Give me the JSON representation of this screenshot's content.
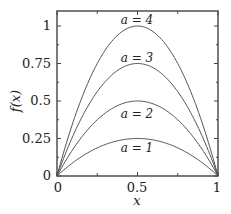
{
  "chart_data": {
    "type": "line",
    "title": "",
    "xlabel": "x",
    "ylabel": "f(x)",
    "xlim": [
      0,
      1
    ],
    "ylim": [
      0,
      1.1
    ],
    "x_ticks": [
      0,
      0.5,
      1
    ],
    "x_tick_labels": [
      "0",
      "0.5",
      "1"
    ],
    "y_ticks": [
      0,
      0.25,
      0.5,
      0.75,
      1
    ],
    "y_tick_labels": [
      "0",
      "0.25",
      "0.5",
      "0.75",
      "1"
    ],
    "grid": false,
    "legend": "none (inline curve labels)",
    "function": "f(x) = a x (1 - x)",
    "x": [
      0,
      0.1,
      0.2,
      0.3,
      0.4,
      0.5,
      0.6,
      0.7,
      0.8,
      0.9,
      1.0
    ],
    "series": [
      {
        "name": "a = 1",
        "a": 1,
        "values": [
          0,
          0.09,
          0.16,
          0.21,
          0.24,
          0.25,
          0.24,
          0.21,
          0.16,
          0.09,
          0
        ],
        "label_position": "below"
      },
      {
        "name": "a = 2",
        "a": 2,
        "values": [
          0,
          0.18,
          0.32,
          0.42,
          0.48,
          0.5,
          0.48,
          0.42,
          0.32,
          0.18,
          0
        ],
        "label_position": "below"
      },
      {
        "name": "a = 3",
        "a": 3,
        "values": [
          0,
          0.27,
          0.48,
          0.63,
          0.72,
          0.75,
          0.72,
          0.63,
          0.48,
          0.27,
          0
        ],
        "label_position": "above"
      },
      {
        "name": "a = 4",
        "a": 4,
        "values": [
          0,
          0.36,
          0.64,
          0.84,
          0.96,
          1.0,
          0.96,
          0.84,
          0.64,
          0.36,
          0
        ],
        "label_position": "above"
      }
    ]
  },
  "labels": {
    "xlabel": "x",
    "ylabel": "f(x)",
    "xticks": [
      "0",
      "0.5",
      "1"
    ],
    "yticks": [
      "0",
      "0.25",
      "0.5",
      "0.75",
      "1"
    ],
    "curves": [
      "a = 1",
      "a = 2",
      "a = 3",
      "a = 4"
    ]
  },
  "colors": {
    "curve": "#555555",
    "frame": "#444444",
    "text": "#222222"
  }
}
